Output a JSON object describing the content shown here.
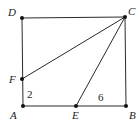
{
  "figure": {
    "type": "geometry",
    "shape": "rectangle ABCD with segments CF and CE",
    "points": {
      "A": {
        "label": "A",
        "x": 23,
        "y": 106
      },
      "B": {
        "label": "B",
        "x": 126,
        "y": 106
      },
      "C": {
        "label": "C",
        "x": 125,
        "y": 17
      },
      "D": {
        "label": "D",
        "x": 22,
        "y": 18
      },
      "E": {
        "label": "E",
        "x": 76,
        "y": 106
      },
      "F": {
        "label": "F",
        "x": 22,
        "y": 79
      }
    },
    "segments": [
      [
        "A",
        "B"
      ],
      [
        "B",
        "C"
      ],
      [
        "C",
        "D"
      ],
      [
        "D",
        "A"
      ],
      [
        "C",
        "F"
      ],
      [
        "C",
        "E"
      ]
    ],
    "measurements": {
      "AF": "2",
      "EB": "6"
    },
    "colors": {
      "line": "#2a2a2a",
      "point": "#111111",
      "text": "#222222"
    }
  }
}
